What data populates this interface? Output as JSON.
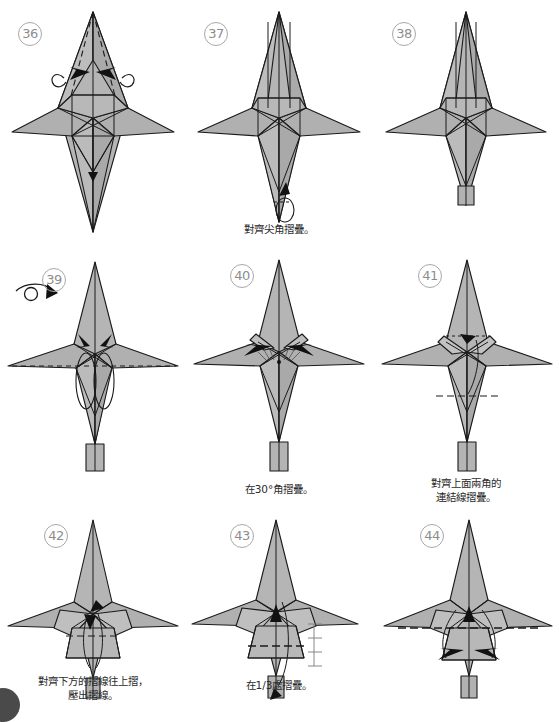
{
  "document": {
    "kind": "origami-instruction-diagram",
    "page_width": 559,
    "page_height": 712,
    "background_color": "#ffffff",
    "paper_fill_color": "#b3b3b3",
    "paper_fill_light": "#c6c6c6",
    "paper_fill_dark": "#a0a0a0",
    "line_color": "#1a1a1a",
    "step_number_color": "#8d8d8d",
    "caption_color": "#2b2b2b"
  },
  "steps": [
    {
      "number": "36",
      "caption": "",
      "symbols": [
        "valley-fold-dashed",
        "double-inward-arrow",
        "curl-arrow-left",
        "curl-arrow-right"
      ]
    },
    {
      "number": "37",
      "caption": "對齊尖角摺疊。",
      "symbols": [
        "down-arrow",
        "loop-arrow-bottom"
      ]
    },
    {
      "number": "38",
      "caption": "",
      "symbols": []
    },
    {
      "number": "39",
      "caption": "",
      "symbols": [
        "turn-over-arrow",
        "horizontal-dashed-fold",
        "double-inward-arrow"
      ]
    },
    {
      "number": "40",
      "caption": "在30°角摺疊。",
      "symbols": [
        "angle-30-marks",
        "outward-arrow-left",
        "outward-arrow-right"
      ]
    },
    {
      "number": "41",
      "caption": "對齊上面兩角的\n連結線摺疊。",
      "symbols": [
        "top-dotted-connector",
        "center-down-arrow",
        "lower-dashed-fold"
      ]
    },
    {
      "number": "42",
      "caption": "對齊下方的摺線往上摺，\n壓出摺線。",
      "symbols": [
        "dashed-fold-line",
        "up-arrow",
        "down-arrow"
      ]
    },
    {
      "number": "43",
      "caption": "在1/3處摺疊。",
      "symbols": [
        "dashed-fold-line",
        "third-measure-marks",
        "down-arrow-bottom"
      ]
    },
    {
      "number": "44",
      "caption": "",
      "symbols": [
        "dashed-center-fold",
        "double-outward-arrow",
        "center-down-arrow"
      ]
    }
  ],
  "labels": {
    "angle_30": "30°",
    "fraction_third": "1/3"
  }
}
